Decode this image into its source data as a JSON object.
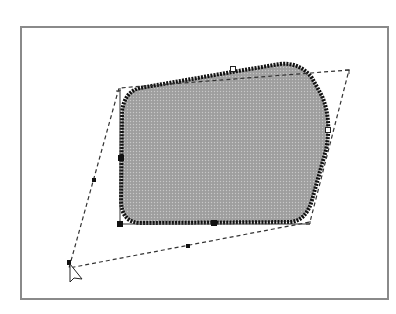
{
  "caption": {
    "text": ""
  },
  "canvas": {
    "frame_color": "#8a8a8a",
    "shape": {
      "fill": "#a9a9a9",
      "outline": "#111111",
      "pattern": "dotted-halftone"
    },
    "transform_outline": {
      "style": "dashed",
      "color": "#333333",
      "corners": [
        [
          349,
          70
        ],
        [
          119,
          88
        ],
        [
          69,
          268
        ],
        [
          310,
          222
        ]
      ]
    },
    "handles": {
      "filled": [
        [
          121,
          158
        ],
        [
          120,
          224
        ],
        [
          214,
          223
        ],
        [
          94,
          180
        ],
        [
          188,
          246
        ],
        [
          69,
          262
        ]
      ],
      "hollow": [
        [
          233,
          70
        ],
        [
          328,
          130
        ]
      ]
    },
    "cursor": {
      "type": "arrow-pointer",
      "position": [
        70,
        266
      ]
    }
  }
}
